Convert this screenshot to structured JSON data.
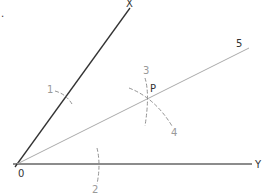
{
  "diagram": {
    "type": "angle-bisector-construction",
    "colors": {
      "arm_line": "#333333",
      "base_line": "#666666",
      "bisector_line": "#aaaaaa",
      "arc": "#888888",
      "label_dark": "#333333",
      "label_grey": "#999999"
    },
    "points": {
      "origin": {
        "label": "0",
        "x": 17,
        "y": 164
      },
      "x_end": {
        "label": "X",
        "x": 130,
        "y": 8
      },
      "y_end": {
        "label": "Y",
        "x": 252,
        "y": 164
      },
      "bisector_end": {
        "label": "5",
        "x": 249,
        "y": 48
      },
      "p": {
        "label": "P",
        "x": 148,
        "y": 96
      }
    },
    "labels": {
      "corner_mark": ".",
      "x": "X",
      "y": "Y",
      "origin": "0",
      "bisector": "5",
      "p": "P",
      "arc1": "1",
      "arc2": "2",
      "arc3": "3",
      "arc4": "4"
    },
    "arcs": [
      {
        "id": "1",
        "desc": "arc crossing OX"
      },
      {
        "id": "2",
        "desc": "arc crossing OY"
      },
      {
        "id": "3",
        "desc": "arc through P from arm 1"
      },
      {
        "id": "4",
        "desc": "arc through P from arm 2"
      }
    ]
  }
}
